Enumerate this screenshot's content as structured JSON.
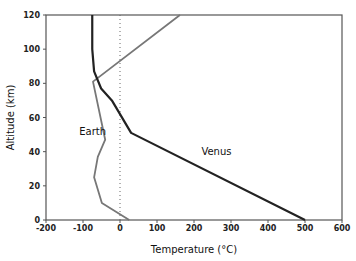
{
  "chart_data": {
    "type": "line",
    "title": "",
    "xlabel": "Temperature (°C)",
    "ylabel": "Altitude (km)",
    "xlim": [
      -200,
      600
    ],
    "ylim": [
      0,
      120
    ],
    "xticks": [
      -200,
      -100,
      0,
      100,
      200,
      300,
      400,
      500,
      600
    ],
    "yticks": [
      0,
      20,
      40,
      60,
      80,
      100,
      120
    ],
    "grid": false,
    "reference_line": {
      "x": 0,
      "style": "dotted"
    },
    "series": [
      {
        "name": "Earth",
        "color": "#777777",
        "points": [
          [
            25,
            0
          ],
          [
            -49,
            10
          ],
          [
            -70,
            25
          ],
          [
            -60,
            37
          ],
          [
            -40,
            47
          ],
          [
            -73,
            81
          ],
          [
            162,
            120
          ]
        ]
      },
      {
        "name": "Venus",
        "color": "#222222",
        "points": [
          [
            500,
            0
          ],
          [
            30,
            51
          ],
          [
            -22,
            70
          ],
          [
            -51,
            77
          ],
          [
            -70,
            87
          ],
          [
            -75,
            100
          ],
          [
            -75,
            120
          ]
        ]
      }
    ],
    "annotations": [
      {
        "text": "Earth",
        "x": -110,
        "y": 50
      },
      {
        "text": "Venus",
        "x": 220,
        "y": 38
      }
    ]
  }
}
